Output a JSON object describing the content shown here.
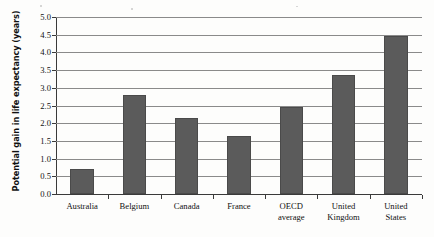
{
  "chart_data": {
    "type": "bar",
    "title": "",
    "xlabel": "",
    "ylabel": "Potential gain in life expectancy (years)",
    "categories": [
      "Australia",
      "Belgium",
      "Canada",
      "France",
      "OECD average",
      "United Kingdom",
      "United States"
    ],
    "category_lines": [
      [
        "Australia",
        ""
      ],
      [
        "Belgium",
        ""
      ],
      [
        "Canada",
        ""
      ],
      [
        "France",
        ""
      ],
      [
        "OECD",
        "average"
      ],
      [
        "United",
        "Kingdom"
      ],
      [
        "United",
        "States"
      ]
    ],
    "values": [
      0.7,
      2.8,
      2.15,
      1.65,
      2.45,
      3.35,
      4.45
    ],
    "ylim": [
      0,
      5
    ],
    "ytick_step": 0.5,
    "ytick_labels": [
      "5.0",
      "4.5",
      "4.0",
      "3.5",
      "3.0",
      "2.5",
      "2.0",
      "1.5",
      "1.0",
      "0.5",
      "0.0"
    ],
    "ytick_values": [
      5.0,
      4.5,
      4.0,
      3.5,
      3.0,
      2.5,
      2.0,
      1.5,
      1.0,
      0.5,
      0.0
    ],
    "grid": true,
    "legend": null,
    "bar_color": "#5b5b5b",
    "axis_color": "#3a3a3a",
    "grid_color": "#8a8a8a"
  }
}
